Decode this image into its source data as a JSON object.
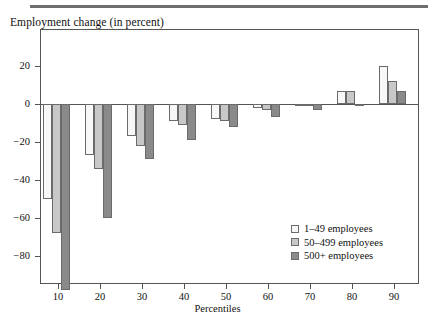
{
  "figure": {
    "top_rule": "horizontal-rule",
    "axis_title": "Employment change (in percent)"
  },
  "chart_data": {
    "type": "bar",
    "title": "Employment change (in percent)",
    "xlabel": "Percentiles",
    "ylabel": "Employment change (in percent)",
    "categories": [
      "10",
      "20",
      "30",
      "40",
      "50",
      "60",
      "70",
      "80",
      "90"
    ],
    "series": [
      {
        "name": "1–49 employees",
        "color": "#f7f7f7",
        "values": [
          -50,
          -27,
          -17,
          -9,
          -8,
          -2,
          0,
          7,
          20
        ]
      },
      {
        "name": "50–499 employees",
        "color": "#c8c8c8",
        "values": [
          -68,
          -34,
          -22,
          -11,
          -9,
          -3,
          -1,
          7,
          12
        ]
      },
      {
        "name": "500+ employees",
        "color": "#8a8a8a",
        "values": [
          -98,
          -60,
          -29,
          -19,
          -12,
          -7,
          -3,
          -1,
          7
        ]
      }
    ],
    "ylim": [
      -100,
      26
    ],
    "yticks": [
      20,
      0,
      -20,
      -40,
      -60,
      -80
    ],
    "ytick_labels": [
      "20",
      "0",
      "−20",
      "−40",
      "−60",
      "−80"
    ],
    "grid": false,
    "legend_position": "lower right"
  },
  "axes": {
    "x_title": "Percentiles",
    "x_tick_labels": [
      "10",
      "20",
      "30",
      "40",
      "50",
      "60",
      "70",
      "80",
      "90"
    ],
    "y_tick_labels": [
      "20",
      "0",
      "−20",
      "−40",
      "−60",
      "−80"
    ]
  },
  "legend": {
    "entries": [
      {
        "label": "1–49 employees",
        "swatch": "white-swatch"
      },
      {
        "label": "50–499 employees",
        "swatch": "light-gray-swatch"
      },
      {
        "label": "500+ employees",
        "swatch": "dark-gray-swatch"
      }
    ]
  }
}
